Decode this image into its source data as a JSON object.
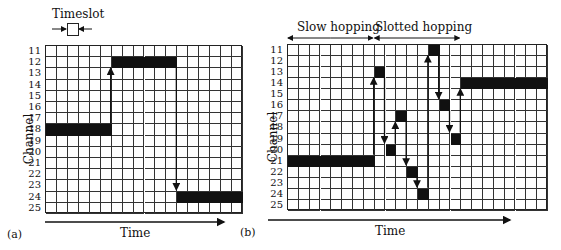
{
  "figure": {
    "panel_a": {
      "caption": "(a)",
      "xlabel": "Time",
      "ylabel": "Channel",
      "legend_label": "Timeslot",
      "channels": [
        11,
        12,
        13,
        14,
        15,
        16,
        17,
        18,
        19,
        20,
        21,
        22,
        23,
        24,
        25
      ],
      "timeslots": 18,
      "occupancy": [
        {
          "channel": 18,
          "start": 0,
          "end": 6
        },
        {
          "channel": 12,
          "start": 6,
          "end": 12
        },
        {
          "channel": 24,
          "start": 12,
          "end": 18
        }
      ],
      "hops": [
        {
          "at": 6,
          "from": 18,
          "to": 12
        },
        {
          "at": 12,
          "from": 12,
          "to": 24
        }
      ]
    },
    "panel_b": {
      "caption": "(b)",
      "xlabel": "Time",
      "ylabel": "Channel",
      "phase_labels": [
        "Slow hopping",
        "Slotted hopping"
      ],
      "phase_spans": [
        [
          0,
          8
        ],
        [
          8,
          16
        ]
      ],
      "channels": [
        11,
        12,
        13,
        14,
        15,
        16,
        17,
        18,
        19,
        20,
        21,
        22,
        23,
        24,
        25
      ],
      "timeslots": 24,
      "occupancy": [
        {
          "channel": 21,
          "start": 0,
          "end": 8
        },
        {
          "channel": 13,
          "start": 8,
          "end": 9
        },
        {
          "channel": 20,
          "start": 9,
          "end": 10
        },
        {
          "channel": 17,
          "start": 10,
          "end": 11
        },
        {
          "channel": 22,
          "start": 11,
          "end": 12
        },
        {
          "channel": 24,
          "start": 12,
          "end": 13
        },
        {
          "channel": 11,
          "start": 13,
          "end": 14
        },
        {
          "channel": 16,
          "start": 14,
          "end": 15
        },
        {
          "channel": 19,
          "start": 15,
          "end": 16
        },
        {
          "channel": 14,
          "start": 16,
          "end": 24
        }
      ],
      "hops": [
        {
          "at": 8,
          "from": 21,
          "to": 13
        },
        {
          "at": 9,
          "from": 13,
          "to": 20
        },
        {
          "at": 10,
          "from": 20,
          "to": 17
        },
        {
          "at": 11,
          "from": 17,
          "to": 22
        },
        {
          "at": 12,
          "from": 22,
          "to": 24
        },
        {
          "at": 13,
          "from": 24,
          "to": 11
        },
        {
          "at": 14,
          "from": 11,
          "to": 16
        },
        {
          "at": 15,
          "from": 16,
          "to": 19
        },
        {
          "at": 16,
          "from": 19,
          "to": 14
        }
      ]
    }
  }
}
